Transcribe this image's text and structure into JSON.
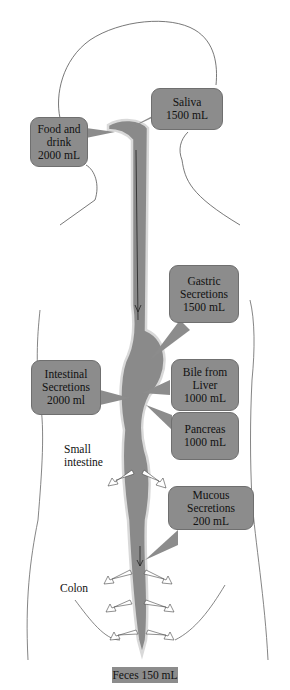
{
  "diagram": {
    "colors": {
      "callout_fill": "#8c8c8c",
      "tract_fill": "#8a8a8a",
      "outline": "#555555",
      "background": "#ffffff"
    },
    "inputs": [
      {
        "id": "food",
        "lines": [
          "Food and",
          "drink",
          "2000 mL"
        ]
      },
      {
        "id": "saliva",
        "lines": [
          "Saliva",
          "1500 mL"
        ]
      },
      {
        "id": "gastric",
        "lines": [
          "Gastric",
          "Secretions",
          "1500 mL"
        ]
      },
      {
        "id": "intestinal",
        "lines": [
          "Intestinal",
          "Secretions",
          "2000 ml"
        ]
      },
      {
        "id": "bile",
        "lines": [
          "Bile from",
          "Liver",
          "1000 mL"
        ]
      },
      {
        "id": "pancreas",
        "lines": [
          "Pancreas",
          "1000 mL"
        ]
      },
      {
        "id": "mucous",
        "lines": [
          "Mucous",
          "Secretions",
          "200 mL"
        ]
      }
    ],
    "labels": {
      "small_intestine": [
        "Small",
        "intestine"
      ],
      "colon": "Colon"
    },
    "output": {
      "label": "Feces 150 mL"
    }
  }
}
